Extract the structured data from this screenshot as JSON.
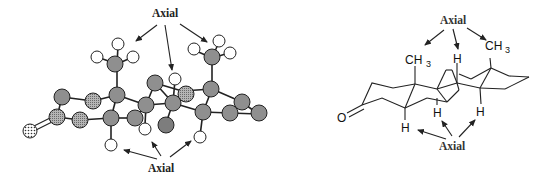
{
  "figure": {
    "left_panel": {
      "type": "ball-and-stick steroid model",
      "top_label": "Axial",
      "bottom_label": "Axial",
      "colors": {
        "carbon_fill": "#8f8f8f",
        "carbon_hatched": "#a8a8a8",
        "hydrogen_fill": "#ffffff",
        "oxygen_fill": "#d0d0d0",
        "bond": "#222222"
      }
    },
    "right_panel": {
      "type": "skeletal chair-form steroid structure",
      "top_label": "Axial",
      "bottom_label": "Axial",
      "atoms": {
        "oxygen": "O",
        "methyl_left": "CH",
        "methyl_left_sub": "3",
        "methyl_right": "CH",
        "methyl_right_sub": "3",
        "h_top": "H",
        "h_bottom_1": "H",
        "h_bottom_2": "H",
        "h_bottom_3": "H"
      }
    }
  }
}
